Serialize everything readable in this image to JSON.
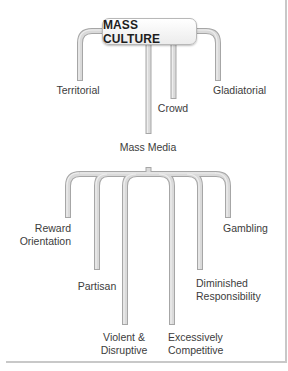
{
  "diagram": {
    "root": "MASS CULTURE",
    "first_level": [
      {
        "label": "Territorial"
      },
      {
        "label": "Crowd"
      },
      {
        "label": "Gladiatorial"
      },
      {
        "label": "Mass Media"
      }
    ],
    "mass_media_children": [
      {
        "line1": "Reward",
        "line2": "Orientation"
      },
      {
        "line1": "Partisan"
      },
      {
        "line1": "Violent &",
        "line2": "Disruptive"
      },
      {
        "line1": "Excessively",
        "line2": "Competitive"
      },
      {
        "line1": "Diminished",
        "line2": "Responsibility"
      },
      {
        "line1": "Gambling"
      }
    ]
  },
  "colors": {
    "pipe_fill": "#d9d9d9",
    "pipe_stroke": "#a6a6a6",
    "text": "#3c3c3c",
    "frame": "#c8c8c8"
  }
}
